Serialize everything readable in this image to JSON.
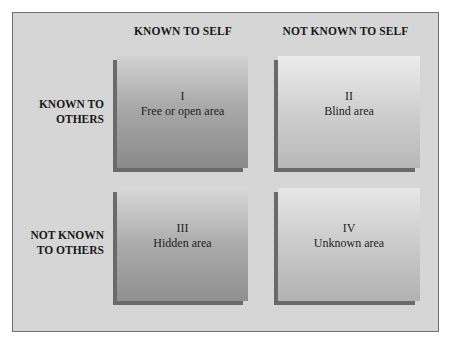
{
  "diagram": {
    "column_headers": [
      "KNOWN TO SELF",
      "NOT KNOWN TO SELF"
    ],
    "row_headers": [
      {
        "line1": "KNOWN TO",
        "line2": "OTHERS"
      },
      {
        "line1": "NOT KNOWN",
        "line2": "TO OTHERS"
      }
    ],
    "cells": [
      {
        "numeral": "I",
        "label": "Free or open area"
      },
      {
        "numeral": "II",
        "label": "Blind area"
      },
      {
        "numeral": "III",
        "label": "Hidden area"
      },
      {
        "numeral": "IV",
        "label": "Unknown area"
      }
    ],
    "colors": {
      "frame_bg": "#d6d6d6",
      "frame_border": "#6f6f6f",
      "shadow": "#6a6a6a",
      "text": "#1a1a1a"
    }
  }
}
